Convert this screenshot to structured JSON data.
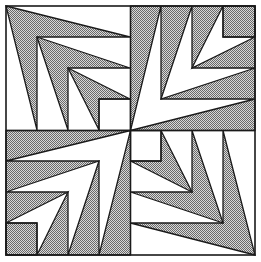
{
  "figure": {
    "title": "",
    "colors": {
      "background": "#ffffff",
      "stroke": "#1a1a1a",
      "pattern_dark": "#6a6a6a",
      "pattern_light": "#d8d8d8"
    },
    "quadrants": [
      {
        "position": "top-left",
        "shaded": "arrows"
      },
      {
        "position": "top-right",
        "shaded": "background"
      },
      {
        "position": "bottom-left",
        "shaded": "background"
      },
      {
        "position": "bottom-right",
        "shaded": "arrows"
      }
    ]
  }
}
